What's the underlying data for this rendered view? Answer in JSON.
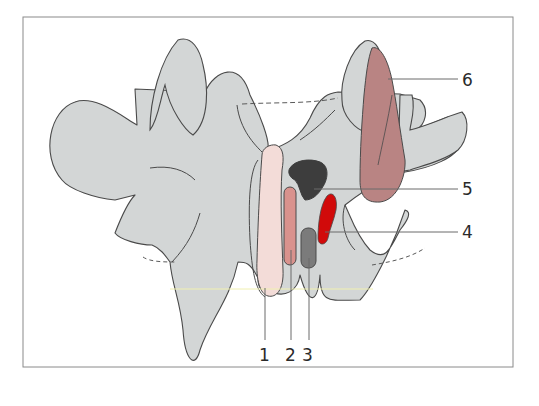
{
  "figure": {
    "labels": [
      {
        "id": "1",
        "text": "1"
      },
      {
        "id": "2",
        "text": "2"
      },
      {
        "id": "3",
        "text": "3"
      },
      {
        "id": "4",
        "text": "4"
      },
      {
        "id": "5",
        "text": "5"
      },
      {
        "id": "6",
        "text": "6"
      }
    ],
    "colors": {
      "bone": "#d3d6d6",
      "outline": "#4a4a4a",
      "structure1": "#f3dcd8",
      "structure2": "#d9928d",
      "structure3": "#7b7b7b",
      "structure4": "#d10a0a",
      "structure5": "#3d3d3d",
      "structure6": "#b98483",
      "leader": "#6b6b6b",
      "frame": "#8a8a8a"
    }
  }
}
